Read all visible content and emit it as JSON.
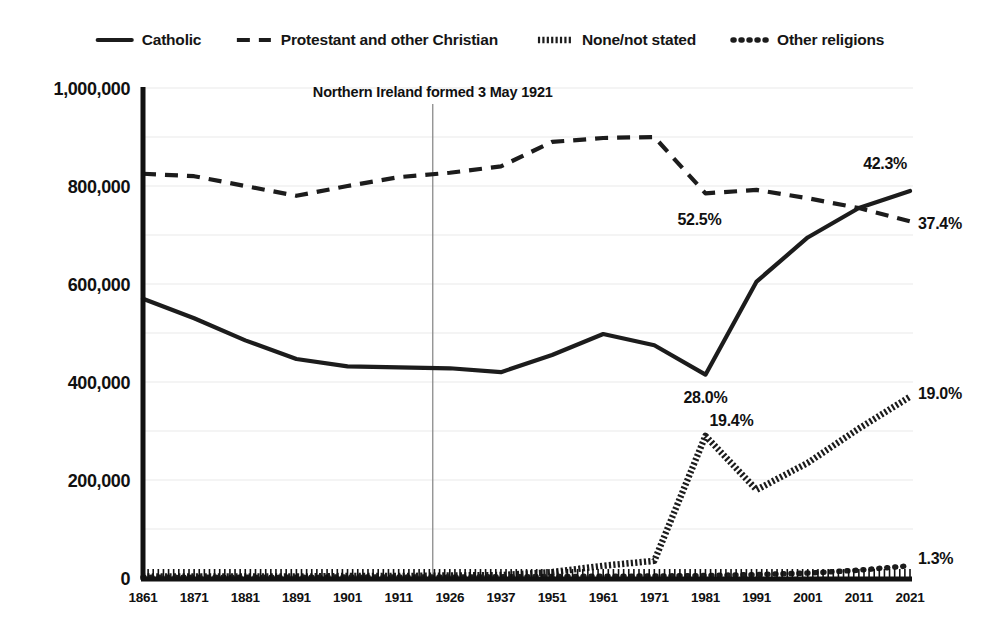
{
  "chart_data": {
    "type": "line",
    "title": "",
    "xlabel": "",
    "ylabel": "",
    "ylim": [
      0,
      1000000
    ],
    "grid": true,
    "legend_position": "top",
    "categories": [
      "1861",
      "1871",
      "1881",
      "1891",
      "1901",
      "1911",
      "1926",
      "1937",
      "1951",
      "1961",
      "1971",
      "1981",
      "1991",
      "2001",
      "2011",
      "2021"
    ],
    "ytick_labels": [
      "0",
      "200,000",
      "400,000",
      "600,000",
      "800,000",
      "1,000,000"
    ],
    "ytick_values": [
      0,
      200000,
      400000,
      600000,
      800000,
      1000000
    ],
    "minor_gridline_values": [
      100000,
      300000,
      500000,
      700000,
      900000
    ],
    "series": [
      {
        "name": "Catholic",
        "style": "solid",
        "values": [
          570000,
          530000,
          485000,
          447000,
          432000,
          430000,
          428000,
          420000,
          455000,
          498000,
          475000,
          415000,
          605000,
          695000,
          755000,
          790000
        ]
      },
      {
        "name": "Protestant and other Christian",
        "style": "dashed",
        "values": [
          825000,
          820000,
          800000,
          780000,
          800000,
          818000,
          827000,
          840000,
          890000,
          898000,
          900000,
          785000,
          792000,
          775000,
          755000,
          728000
        ]
      },
      {
        "name": "None/not stated",
        "style": "hatched",
        "values": [
          3000,
          3000,
          3000,
          3000,
          4000,
          4000,
          5000,
          6000,
          12000,
          25000,
          35000,
          290000,
          180000,
          235000,
          305000,
          370000
        ]
      },
      {
        "name": "Other religions",
        "style": "dotted",
        "values": [
          1500,
          1500,
          1500,
          1500,
          2000,
          2000,
          2000,
          2500,
          3000,
          3500,
          4000,
          5000,
          7000,
          10000,
          16000,
          25000
        ]
      }
    ],
    "point_labels": [
      {
        "text": "42.3%",
        "series": "Catholic",
        "category": "2021",
        "anchor": "end",
        "dx": -3,
        "dy": -22
      },
      {
        "text": "37.4%",
        "series": "Protestant and other Christian",
        "category": "2021",
        "anchor": "start",
        "dx": 8,
        "dy": 8
      },
      {
        "text": "52.5%",
        "series": "Protestant and other Christian",
        "category": "1981",
        "anchor": "middle",
        "dx": -6,
        "dy": 32
      },
      {
        "text": "28.0%",
        "series": "Catholic",
        "category": "1981",
        "anchor": "middle",
        "dx": 0,
        "dy": 28
      },
      {
        "text": "19.4%",
        "series": "None/not stated",
        "category": "1981",
        "anchor": "start",
        "dx": 4,
        "dy": -10
      },
      {
        "text": "19.0%",
        "series": "None/not stated",
        "category": "2021",
        "anchor": "start",
        "dx": 8,
        "dy": 2
      },
      {
        "text": "1.3%",
        "series": "Other religions",
        "category": "2021",
        "anchor": "start",
        "dx": 8,
        "dy": -2
      }
    ],
    "annotations": [
      {
        "text": "Northern Ireland formed 3 May 1921",
        "type": "vertical-rule-with-label",
        "x_position": 1921
      }
    ],
    "legend": [
      {
        "label": "Catholic",
        "style": "solid"
      },
      {
        "label": "Protestant and other Christian",
        "style": "dashed"
      },
      {
        "label": "None/not stated",
        "style": "hatched"
      },
      {
        "label": "Other religions",
        "style": "dotted"
      }
    ],
    "colors": {
      "series": "#1c1c1c",
      "axis": "#111111",
      "gridline": "#e9e9e9",
      "annotation_rule": "#8a8a8a",
      "background": "#ffffff"
    }
  }
}
